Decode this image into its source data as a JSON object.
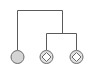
{
  "diagram": {
    "type": "tree-hierarchy-icon",
    "colors": {
      "line": "#5a5a5a",
      "leaf_fill": "#d4d4d4",
      "node_fill": "#e2e2e2",
      "background": "#ffffff"
    },
    "nodes": [
      {
        "id": "leaf-left",
        "shape": "filled-circle",
        "icon": "circle-icon"
      },
      {
        "id": "leaf-middle",
        "shape": "circle-with-diamond",
        "icon": "diamond-node-icon"
      },
      {
        "id": "leaf-right",
        "shape": "circle-with-diamond",
        "icon": "diamond-node-icon"
      }
    ]
  }
}
